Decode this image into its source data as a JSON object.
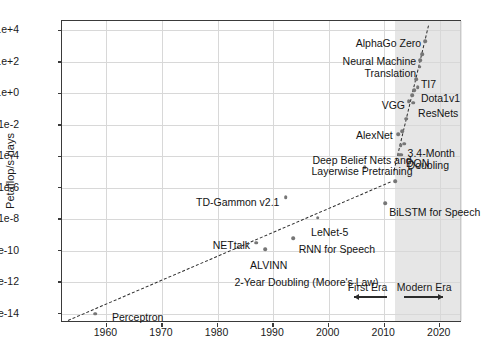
{
  "chart_data": {
    "type": "scatter",
    "title": "",
    "xlabel": "",
    "ylabel": "Petaflop/s-days",
    "xlim": [
      1952,
      2024
    ],
    "ylim": [
      -14.6,
      4.6
    ],
    "y_scale": "log10",
    "grid": true,
    "legend": "none",
    "xticks": [
      "1960",
      "1970",
      "1980",
      "1990",
      "2000",
      "2010",
      "2020"
    ],
    "xtick_values": [
      1960,
      1970,
      1980,
      1990,
      2000,
      2010,
      2020
    ],
    "yticks": [
      "1e+4",
      "1e+2",
      "1e+0",
      "1e-2",
      "1e-4",
      "1e-6",
      "1e-8",
      "1e-10",
      "1e-12",
      "1e-14"
    ],
    "ytick_exponents": [
      4,
      2,
      0,
      -2,
      -4,
      -6,
      -8,
      -10,
      -12,
      -14
    ],
    "points": [
      {
        "label": "Perceptron",
        "x": 1958.0,
        "y": -14.0
      },
      {
        "label": "NETtalk",
        "x": 1987.0,
        "y": -9.5
      },
      {
        "label": "ALVINN",
        "x": 1988.6,
        "y": -9.9
      },
      {
        "label": "TD-Gammon v2.1",
        "x": 1992.3,
        "y": -6.6
      },
      {
        "label": "RNN for Speech",
        "x": 1993.6,
        "y": -9.2
      },
      {
        "label": "LeNet-5",
        "x": 1998.0,
        "y": -7.9
      },
      {
        "label": "Deep Belief Nets and Layerwise Pretraining",
        "x": 2006.5,
        "y": -4.7
      },
      {
        "label": "BiLSTM for Speech",
        "x": 2010.2,
        "y": -7.0
      },
      {
        "label": "",
        "x": 2012.0,
        "y": -5.6
      },
      {
        "label": "DQN",
        "x": 2013.1,
        "y": -3.9
      },
      {
        "label": "",
        "x": 2012.7,
        "y": -3.9
      },
      {
        "label": "AlexNet",
        "x": 2012.5,
        "y": -2.6
      },
      {
        "label": "",
        "x": 2013.2,
        "y": -2.4
      },
      {
        "label": "",
        "x": 2013.0,
        "y": -3.3
      },
      {
        "label": "",
        "x": 2013.6,
        "y": -3.2
      },
      {
        "label": "",
        "x": 2014.0,
        "y": -1.6
      },
      {
        "label": "VGG",
        "x": 2014.4,
        "y": -0.5
      },
      {
        "label": "ResNets",
        "x": 2015.2,
        "y": -0.6
      },
      {
        "label": "",
        "x": 2015.0,
        "y": -0.1
      },
      {
        "label": "",
        "x": 2015.4,
        "y": 0.2
      },
      {
        "label": "TI7",
        "x": 2015.8,
        "y": 0.9
      },
      {
        "label": "Dota1v1",
        "x": 2016.0,
        "y": 0.4
      },
      {
        "label": "Neural Machine Translation",
        "x": 2016.4,
        "y": 1.7
      },
      {
        "label": "",
        "x": 2016.5,
        "y": 2.1
      },
      {
        "label": "",
        "x": 2016.8,
        "y": 2.5
      },
      {
        "label": "AlphaGo Zero",
        "x": 2017.4,
        "y": 3.3
      }
    ],
    "trend_lines": [
      {
        "label": "2-Year Doubling (Moore's Law)",
        "doubling_time": "2 years",
        "x_start": 1953.0,
        "y_start": -14.4,
        "x_end": 2011.0,
        "y_end": -5.6,
        "style": "dashed"
      },
      {
        "label": "3.4-Month Doubling",
        "doubling_time": "3.4 months",
        "x_start": 2011.8,
        "y_start": -4.9,
        "x_end": 2018.0,
        "y_end": 4.3,
        "style": "dashed"
      }
    ],
    "annotations": [
      {
        "name": "alphago-zero",
        "text": "AlphaGo Zero",
        "x": 2017.0,
        "y": 3.5,
        "align": "right"
      },
      {
        "name": "neural-machine-translation",
        "text": "Neural Machine\nTranslation",
        "x": 2016.1,
        "y": 2.35,
        "align": "right"
      },
      {
        "name": "ti7",
        "text": "TI7",
        "x": 2016.6,
        "y": 0.9,
        "align": "left"
      },
      {
        "name": "dota1v1",
        "text": "Dota1v1",
        "x": 2016.6,
        "y": 0.05,
        "align": "left"
      },
      {
        "name": "vgg",
        "text": "VGG",
        "x": 2014.1,
        "y": -0.45,
        "align": "right"
      },
      {
        "name": "resnets",
        "text": "ResNets",
        "x": 2016.1,
        "y": -0.95,
        "align": "left"
      },
      {
        "name": "alexnet",
        "text": "AlexNet",
        "x": 2011.9,
        "y": -2.35,
        "align": "right"
      },
      {
        "name": "three-four-month-doubling",
        "text": "3.4-Month\nDoubling",
        "x": 2014.2,
        "y": -3.5,
        "align": "left"
      },
      {
        "name": "dqn",
        "text": "DQN",
        "x": 2013.9,
        "y": -4.1,
        "align": "left"
      },
      {
        "name": "deep-belief-nets",
        "text": "Deep Belief Nets and\nLayerwise Pretraining",
        "x": 2006.0,
        "y": -3.9,
        "align": "center"
      },
      {
        "name": "bilstm-for-speech",
        "text": "BiLSTM for Speech",
        "x": 2010.9,
        "y": -7.2,
        "align": "left"
      },
      {
        "name": "td-gammon",
        "text": "TD-Gammon v2.1",
        "x": 1991.5,
        "y": -6.6,
        "align": "right"
      },
      {
        "name": "lenet-5",
        "text": "LeNet-5",
        "x": 2000.2,
        "y": -8.5,
        "align": "center"
      },
      {
        "name": "rnn-for-speech",
        "text": "RNN for Speech",
        "x": 1994.6,
        "y": -9.6,
        "align": "left"
      },
      {
        "name": "netttalk",
        "text": "NETtalk",
        "x": 1986.2,
        "y": -9.3,
        "align": "right"
      },
      {
        "name": "alvinn",
        "text": "ALVINN",
        "x": 1989.2,
        "y": -10.6,
        "align": "center"
      },
      {
        "name": "two-year-doubling",
        "text": "2-Year Doubling (Moore's Law)",
        "x": 1996.0,
        "y": -11.7,
        "align": "center"
      },
      {
        "name": "perceptron",
        "text": "Perceptron",
        "x": 1961.0,
        "y": -13.9,
        "align": "left"
      }
    ],
    "shaded_region": {
      "name": "modern-era-shading",
      "x_start": 2012.0,
      "x_end": 2024.0,
      "color": "#e2e2e2"
    },
    "eras": [
      {
        "name": "first-era",
        "label": "First Era",
        "x_label": 2007.0,
        "arrow_from": 2010.5,
        "arrow_to": 2004.5,
        "direction": "left"
      },
      {
        "name": "modern-era",
        "label": "Modern Era",
        "x_label": 2017.2,
        "arrow_from": 2013.6,
        "arrow_to": 2020.6,
        "direction": "right"
      }
    ]
  }
}
